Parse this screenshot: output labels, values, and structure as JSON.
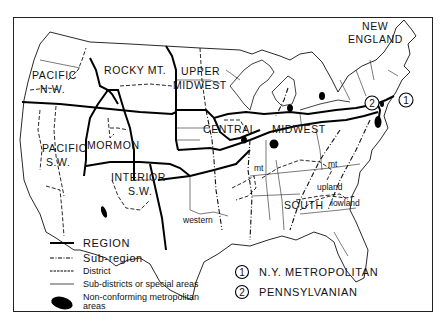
{
  "map": {
    "title": "",
    "regions": [
      {
        "id": "pacific-nw",
        "label_lines": [
          "PACIFIC",
          "N.W."
        ]
      },
      {
        "id": "pacific-sw",
        "label_lines": [
          "PACIFIC",
          "S.W."
        ]
      },
      {
        "id": "rocky-mt",
        "label_lines": [
          "ROCKY MT."
        ]
      },
      {
        "id": "mormon",
        "label_lines": [
          "MORMON"
        ]
      },
      {
        "id": "interior-sw",
        "label_lines": [
          "INTERIOR",
          "S.W."
        ]
      },
      {
        "id": "upper-midwest",
        "label_lines": [
          "UPPER",
          "MIDWEST"
        ]
      },
      {
        "id": "central-midwest",
        "label_lines": [
          "CENTRAL",
          "MIDWEST"
        ]
      },
      {
        "id": "new-england",
        "label_lines": [
          "NEW",
          "ENGLAND"
        ]
      },
      {
        "id": "south",
        "label_lines": [
          "SOUTH"
        ]
      }
    ],
    "subregion_labels": {
      "western": "western",
      "mt_west": "mt",
      "mt_east": "mt",
      "upland": "upland",
      "lowland": "lowland"
    },
    "markers": [
      {
        "number": "1",
        "name": "N.Y. METROPOLITAN"
      },
      {
        "number": "2",
        "name": "PENNSYLVANIAN"
      }
    ]
  },
  "legend": {
    "items": [
      {
        "symbol": "solid-thick-line",
        "label": "REGION"
      },
      {
        "symbol": "dash-dot-line",
        "label": "Sub-region"
      },
      {
        "symbol": "dashed-line",
        "label": "District"
      },
      {
        "symbol": "thin-line",
        "label": "Sub-districts or special areas"
      },
      {
        "symbol": "black-ellipse",
        "label_lines": [
          "Non-conforming metropolitan",
          "areas"
        ]
      }
    ],
    "numbered": [
      {
        "number": "1",
        "label": "N.Y. METROPOLITAN"
      },
      {
        "number": "2",
        "label": "PENNSYLVANIAN"
      }
    ]
  }
}
